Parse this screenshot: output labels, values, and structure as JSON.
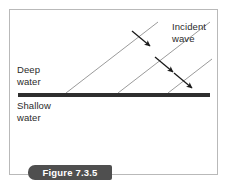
{
  "figure": {
    "caption": "Figure 7.3.5",
    "border_color": "#b9b9b9",
    "background": "#ffffff"
  },
  "labels": {
    "deep_water": "Deep\nwater",
    "shallow_water": "Shallow\nwater",
    "incident_wave": "Incident\nwave"
  },
  "diagram": {
    "boundary": {
      "name": "deep-shallow-boundary-line",
      "color": "#2e2e2e",
      "x1": 18,
      "y1": 95,
      "x2": 210,
      "y2": 95,
      "thickness": 4
    },
    "rays": [
      {
        "name": "incident-ray-1",
        "x1": 66,
        "y1": 93,
        "x2": 158,
        "y2": 22,
        "color": "#9b9b9b"
      },
      {
        "name": "incident-ray-2",
        "x1": 118,
        "y1": 93,
        "x2": 210,
        "y2": 22,
        "color": "#9b9b9b"
      },
      {
        "name": "incident-ray-3",
        "x1": 168,
        "y1": 93,
        "x2": 212,
        "y2": 59,
        "color": "#9b9b9b"
      }
    ],
    "arrows": [
      {
        "name": "direction-arrow-1",
        "x1": 132,
        "y1": 31,
        "x2": 152,
        "y2": 48,
        "color": "#1a1a1a"
      },
      {
        "name": "direction-arrow-2",
        "x1": 155,
        "y1": 57,
        "x2": 175,
        "y2": 74,
        "color": "#1a1a1a"
      },
      {
        "name": "direction-arrow-3",
        "x1": 174,
        "y1": 73,
        "x2": 194,
        "y2": 90,
        "color": "#1a1a1a"
      }
    ]
  },
  "caption_banner": {
    "background": "#4f4f4f",
    "text_color": "#ffffff"
  }
}
